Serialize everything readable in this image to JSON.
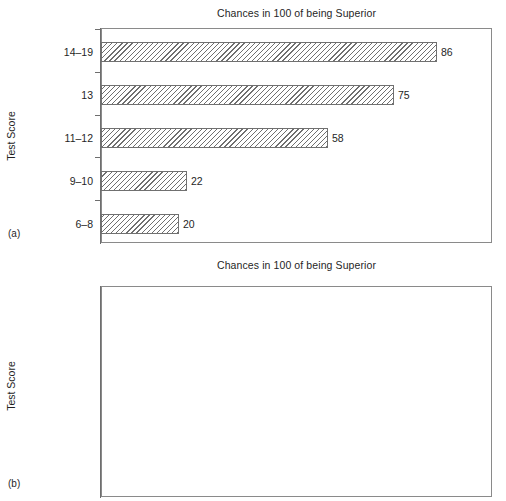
{
  "figure": {
    "background": "#ffffff",
    "bar_edge_color": "#707070",
    "hatch": "diagonal-45",
    "axis_color": "#6e6e6e"
  },
  "panels": [
    {
      "tag": "(a)",
      "title": "Chances in 100 of being Superior",
      "ylabel": "Test Score"
    },
    {
      "tag": "(b)",
      "title": "Chances in 100 of being Superior",
      "ylabel": "Test Score"
    }
  ],
  "chart_data": [
    {
      "type": "bar",
      "orientation": "horizontal",
      "title": "Chances in 100 of being Superior",
      "xlabel": "",
      "ylabel": "Test Score",
      "xlim": [
        0,
        100
      ],
      "grid": false,
      "legend": false,
      "panel": "(a)",
      "categories": [
        "14–19",
        "13",
        "11–12",
        "9–10",
        "6–8"
      ],
      "values": [
        86,
        75,
        58,
        22,
        20
      ],
      "data_labels": [
        "86",
        "75",
        "58",
        "22",
        "20"
      ]
    },
    {
      "type": "bar",
      "orientation": "horizontal",
      "title": "Chances in 100 of being Superior",
      "xlabel": "",
      "ylabel": "Test Score",
      "xlim": [
        0,
        100
      ],
      "grid": false,
      "legend": false,
      "panel": "(b)",
      "categories": [
        "High 20%",
        "Next 20%",
        "Middle 20%",
        "Next 20%",
        "Low 20%"
      ],
      "values": [
        73,
        59,
        50,
        41,
        28
      ],
      "data_labels": [
        "73",
        "59",
        "50",
        "41",
        "28"
      ]
    }
  ]
}
